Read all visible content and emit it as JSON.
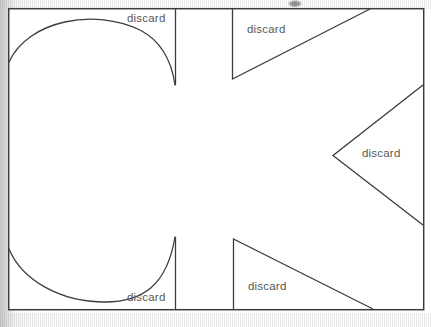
{
  "page": {
    "background_color": "#d2d2d2",
    "paper_color": "#fdfdfd",
    "ink_color": "#3a3a3a",
    "label_color": "#585858"
  },
  "figure": {
    "outline": {
      "name": "work-rectangle",
      "x": 8,
      "y": 8,
      "width": 416,
      "height": 302,
      "stroke": "#3c3c3c",
      "stroke_width": 1.4
    },
    "cut_regions": [
      {
        "id": "top-left-arc",
        "kind": "arc",
        "label": "discard",
        "label_x": 127,
        "label_y": 12
      },
      {
        "id": "top-right-triangle",
        "kind": "triangle",
        "label": "discard",
        "label_x": 247,
        "label_y": 23
      },
      {
        "id": "right-middle-triangle",
        "kind": "triangle",
        "label": "discard",
        "label_x": 362,
        "label_y": 147
      },
      {
        "id": "bottom-left-arc",
        "kind": "arc",
        "label": "discard",
        "label_x": 127,
        "label_y": 291
      },
      {
        "id": "bottom-right-triangle",
        "kind": "triangle",
        "label": "discard",
        "label_x": 248,
        "label_y": 280
      }
    ]
  },
  "labels": {
    "discard": "discard"
  }
}
